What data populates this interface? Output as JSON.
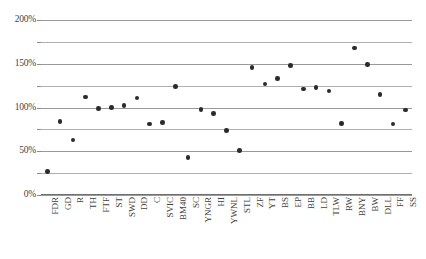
{
  "chart_data": {
    "type": "scatter",
    "title": "",
    "xlabel": "",
    "ylabel": "",
    "ylim": [
      0,
      200
    ],
    "ytick_values": [
      0,
      25,
      50,
      75,
      100,
      125,
      150,
      175,
      200
    ],
    "ytick_labels_major": [
      "0%",
      "50%",
      "100%",
      "150%",
      "200%"
    ],
    "ytick_major_values": [
      0,
      50,
      100,
      150,
      200
    ],
    "grid": true,
    "grid_axis": "y",
    "legend": false,
    "legend_position": "none",
    "marker": "circle",
    "marker_color": "#2b2b2b",
    "categories": [
      "FDR",
      "GD",
      "R",
      "TH",
      "FTF",
      "ST",
      "SWD",
      "DD",
      "C",
      "SVIC",
      "BM40",
      "SC",
      "YNGR",
      "HI",
      "YWNL",
      "STL",
      "ZF",
      "YT",
      "BS",
      "EP",
      "BB",
      "LD",
      "TLW",
      "RW",
      "BNY",
      "BW",
      "DLL",
      "FF",
      "SS"
    ],
    "values": [
      27,
      84,
      63,
      112,
      99,
      100,
      102,
      111,
      81,
      83,
      124,
      43,
      98,
      93,
      74,
      51,
      146,
      127,
      133,
      148,
      121,
      123,
      119,
      82,
      168,
      149,
      115,
      81,
      97
    ],
    "points": [
      {
        "label": "FDR",
        "value": 27
      },
      {
        "label": "GD",
        "value": 84
      },
      {
        "label": "R",
        "value": 63
      },
      {
        "label": "TH",
        "value": 112
      },
      {
        "label": "FTF",
        "value": 99
      },
      {
        "label": "ST",
        "value": 100
      },
      {
        "label": "SWD",
        "value": 102
      },
      {
        "label": "DD",
        "value": 111
      },
      {
        "label": "C",
        "value": 81
      },
      {
        "label": "SVIC",
        "value": 83
      },
      {
        "label": "BM40",
        "value": 124
      },
      {
        "label": "SC",
        "value": 43
      },
      {
        "label": "YNGR",
        "value": 98
      },
      {
        "label": "HI",
        "value": 93
      },
      {
        "label": "YWNL",
        "value": 74
      },
      {
        "label": "STL",
        "value": 51
      },
      {
        "label": "ZF",
        "value": 146
      },
      {
        "label": "YT",
        "value": 127
      },
      {
        "label": "BS",
        "value": 133
      },
      {
        "label": "EP",
        "value": 148
      },
      {
        "label": "BB",
        "value": 121
      },
      {
        "label": "LD",
        "value": 123
      },
      {
        "label": "TLW",
        "value": 119
      },
      {
        "label": "RW",
        "value": 82
      },
      {
        "label": "BNY",
        "value": 168
      },
      {
        "label": "BW",
        "value": 149
      },
      {
        "label": "DLL",
        "value": 115
      },
      {
        "label": "FF",
        "value": 81
      },
      {
        "label": "SS",
        "value": 97
      }
    ]
  }
}
